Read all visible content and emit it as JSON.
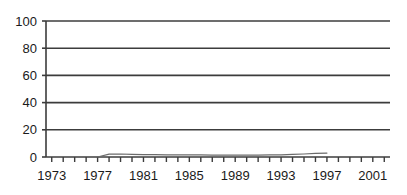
{
  "chart_data": {
    "type": "line",
    "title": "",
    "subtitle": "",
    "xlabel": "",
    "ylabel": "",
    "xlim": [
      1972.5,
      2002.5
    ],
    "ylim": [
      0,
      100
    ],
    "grid": true,
    "grid_axis": "y",
    "legend": false,
    "legend_position": "none",
    "y_ticks": [
      0,
      20,
      40,
      60,
      80,
      100
    ],
    "y_tick_labels": [
      "0",
      "20",
      "40",
      "60",
      "80",
      "100"
    ],
    "x_tick_labels": [
      "1973",
      "1977",
      "1981",
      "1985",
      "1989",
      "1993",
      "1997",
      "2001"
    ],
    "x_tick_label_years": [
      1973,
      1977,
      1981,
      1985,
      1989,
      1993,
      1997,
      2001
    ],
    "x_minor_ticks_every_year": true,
    "x_tick_years": [
      1973,
      1974,
      1975,
      1976,
      1977,
      1978,
      1979,
      1980,
      1981,
      1982,
      1983,
      1984,
      1985,
      1986,
      1987,
      1988,
      1989,
      1990,
      1991,
      1992,
      1993,
      1994,
      1995,
      1996,
      1997,
      1998,
      1999,
      2000,
      2001,
      2002
    ],
    "series": [
      {
        "name": "series-1",
        "color": "#6b6b6b",
        "x": [
          1977,
          1978,
          1979,
          1980,
          1981,
          1982,
          1983,
          1984,
          1985,
          1986,
          1987,
          1988,
          1989,
          1990,
          1991,
          1992,
          1993,
          1994,
          1995,
          1996,
          1997
        ],
        "values": [
          0,
          2.1,
          2.2,
          2.0,
          1.8,
          1.7,
          1.6,
          1.6,
          1.5,
          1.5,
          1.4,
          1.4,
          1.4,
          1.4,
          1.4,
          1.5,
          1.6,
          1.9,
          2.2,
          2.6,
          2.9
        ]
      }
    ],
    "colors": {
      "axis": "#3c3c3c",
      "gridline": "#3c3c3c",
      "series": "#6b6b6b",
      "text": "#1a1a1a",
      "background": "#ffffff"
    },
    "geometry": {
      "plot_left": 46,
      "plot_right": 390,
      "plot_top": 21,
      "plot_bottom": 157
    }
  }
}
